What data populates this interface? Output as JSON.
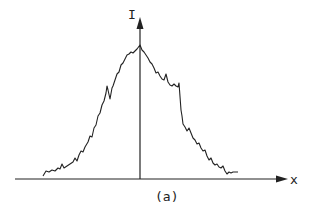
{
  "figure": {
    "y_axis_label": "I",
    "x_axis_label": "x",
    "caption": "(a)",
    "line_color": "#222222"
  },
  "chart_data": {
    "type": "line",
    "title": "",
    "xlabel": "x",
    "ylabel": "I",
    "caption": "(a)",
    "grid": false,
    "legend": null,
    "points_px": [
      [
        43,
        176
      ],
      [
        46,
        171
      ],
      [
        49,
        172
      ],
      [
        52,
        170
      ],
      [
        55,
        171
      ],
      [
        58,
        168
      ],
      [
        60,
        169
      ],
      [
        62,
        164
      ],
      [
        64,
        168
      ],
      [
        67,
        166
      ],
      [
        70,
        164
      ],
      [
        73,
        162
      ],
      [
        75,
        158
      ],
      [
        77,
        161
      ],
      [
        79,
        155
      ],
      [
        81,
        151
      ],
      [
        83,
        152
      ],
      [
        85,
        147
      ],
      [
        88,
        142
      ],
      [
        90,
        136
      ],
      [
        92,
        137
      ],
      [
        94,
        128
      ],
      [
        96,
        125
      ],
      [
        98,
        116
      ],
      [
        100,
        113
      ],
      [
        102,
        105
      ],
      [
        104,
        101
      ],
      [
        106,
        93
      ],
      [
        107,
        86
      ],
      [
        108,
        90
      ],
      [
        110,
        99
      ],
      [
        112,
        88
      ],
      [
        113,
        86
      ],
      [
        115,
        80
      ],
      [
        117,
        74
      ],
      [
        119,
        72
      ],
      [
        121,
        65
      ],
      [
        123,
        63
      ],
      [
        125,
        59
      ],
      [
        127,
        55
      ],
      [
        129,
        54
      ],
      [
        131,
        52
      ],
      [
        133,
        53
      ],
      [
        135,
        51
      ],
      [
        137,
        49
      ],
      [
        140,
        45
      ],
      [
        142,
        50
      ],
      [
        144,
        52
      ],
      [
        146,
        55
      ],
      [
        148,
        58
      ],
      [
        150,
        62
      ],
      [
        152,
        64
      ],
      [
        154,
        68
      ],
      [
        156,
        73
      ],
      [
        158,
        72
      ],
      [
        160,
        76
      ],
      [
        162,
        79
      ],
      [
        164,
        80
      ],
      [
        166,
        74
      ],
      [
        168,
        82
      ],
      [
        170,
        85
      ],
      [
        172,
        86
      ],
      [
        174,
        84
      ],
      [
        176,
        86
      ],
      [
        178,
        87
      ],
      [
        179,
        83
      ],
      [
        181,
        110
      ],
      [
        182,
        116
      ],
      [
        183,
        124
      ],
      [
        185,
        127
      ],
      [
        187,
        131
      ],
      [
        189,
        128
      ],
      [
        191,
        133
      ],
      [
        193,
        138
      ],
      [
        195,
        140
      ],
      [
        197,
        144
      ],
      [
        199,
        143
      ],
      [
        201,
        148
      ],
      [
        203,
        151
      ],
      [
        205,
        150
      ],
      [
        207,
        156
      ],
      [
        209,
        160
      ],
      [
        211,
        158
      ],
      [
        213,
        163
      ],
      [
        215,
        165
      ],
      [
        217,
        164
      ],
      [
        219,
        167
      ],
      [
        221,
        168
      ],
      [
        223,
        166
      ],
      [
        225,
        171
      ],
      [
        227,
        174
      ],
      [
        229,
        172
      ],
      [
        231,
        173
      ],
      [
        233,
        172
      ],
      [
        235,
        172
      ],
      [
        238,
        172
      ]
    ]
  }
}
